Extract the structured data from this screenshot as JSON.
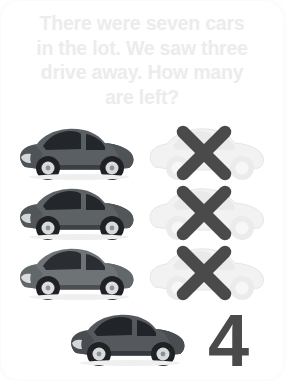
{
  "card": {
    "background_color": "#ffffff",
    "border_radius_px": 20
  },
  "prompt": {
    "text": "There were seven cars\nin the lot. We saw three\ndrive away. How many\nare left?",
    "lines": [
      "There were seven cars",
      "in the lot. We saw three",
      "drive away. How many",
      "are left?"
    ],
    "color": "#ececec"
  },
  "colors": {
    "car_body": "#5a5f63",
    "car_body_dark": "#3f4347",
    "car_window": "#23262a",
    "car_tire": "#1f2124",
    "car_rim": "#d8dadc",
    "ghost_car_body": "#f0f0f0",
    "ghost_car_outline": "#e4e4e4",
    "x_mark": "#4a4a4a",
    "answer": "#4a4a4a",
    "background": "#ffffff"
  },
  "rows": [
    {
      "index": 1,
      "left": {
        "kind": "car",
        "state": "present",
        "label": "car-remaining"
      },
      "right": {
        "kind": "car",
        "state": "removed",
        "label": "car-driven-away",
        "mark": "X"
      }
    },
    {
      "index": 2,
      "left": {
        "kind": "car",
        "state": "present",
        "label": "car-remaining"
      },
      "right": {
        "kind": "car",
        "state": "removed",
        "label": "car-driven-away",
        "mark": "X"
      }
    },
    {
      "index": 3,
      "left": {
        "kind": "car",
        "state": "present",
        "label": "car-remaining"
      },
      "right": {
        "kind": "car",
        "state": "removed",
        "label": "car-driven-away",
        "mark": "X"
      }
    }
  ],
  "bottom_row": {
    "car": {
      "kind": "car",
      "state": "present",
      "label": "car-remaining"
    },
    "answer": "4"
  },
  "counts": {
    "total_cars": 7,
    "cars_removed": 3,
    "cars_left": 4
  }
}
